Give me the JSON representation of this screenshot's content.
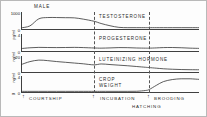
{
  "figure": {
    "title": "MALE",
    "border_color": "#b9b9b9",
    "axis_color": "#404040",
    "curve_color": "#333333"
  },
  "panels": [
    {
      "label": "TESTOSTERONE",
      "unit": "pg/ml",
      "axis_max": "1000",
      "axis_min": "0",
      "label_left": 78,
      "label_top": 2
    },
    {
      "label": "PROGESTERONE",
      "unit": "ng/ml",
      "axis_max": "4",
      "axis_min": "0",
      "label_left": 78,
      "label_top": 2
    },
    {
      "label": "LUTEINIZING HORMONE",
      "unit": "ng/ml",
      "axis_max": "20",
      "axis_min": "0",
      "label_left": 78,
      "label_top": 1
    },
    {
      "label": "CROP\nWEIGHT",
      "label_line1": "CROP",
      "label_line2": "WEIGHT",
      "unit": "g",
      "axis_max": "4",
      "axis_min": "0",
      "label_left": 78,
      "label_top": 1
    }
  ],
  "stages": {
    "courtship": "COURTSHIP",
    "incubation": "INCUBATION",
    "brooding": "BROODING",
    "hatching": "HATCHING",
    "arrow_glyph": "↑"
  },
  "chart_data": {
    "type": "line",
    "title": "MALE",
    "xlabel": "",
    "x_stages": [
      "COURTSHIP",
      "INCUBATION",
      "BROODING"
    ],
    "stage_boundaries_pct": [
      41.0,
      72.0
    ],
    "hatching_marker_pct": 72.0,
    "grid": false,
    "legend": "inline-right",
    "x": [
      0,
      5,
      10,
      15,
      20,
      25,
      30,
      35,
      41,
      45,
      50,
      55,
      60,
      65,
      70,
      72,
      76,
      80,
      85,
      90,
      95,
      100
    ],
    "series": [
      {
        "name": "TESTOSTERONE",
        "ylabel": "pg/ml",
        "ylim": [
          0,
          1000
        ],
        "yticks": [
          0,
          1000
        ],
        "values": [
          60,
          180,
          620,
          700,
          700,
          690,
          680,
          600,
          470,
          330,
          190,
          90,
          70,
          70,
          70,
          70,
          70,
          70,
          70,
          70,
          70,
          70
        ]
      },
      {
        "name": "PROGESTERONE",
        "ylabel": "ng/ml",
        "ylim": [
          0,
          4
        ],
        "yticks": [
          0,
          4
        ],
        "values": [
          0.55,
          0.75,
          0.85,
          0.82,
          0.8,
          0.82,
          0.85,
          0.8,
          0.7,
          0.66,
          0.72,
          0.8,
          0.78,
          0.7,
          0.66,
          0.66,
          0.72,
          0.8,
          0.82,
          0.76,
          0.66,
          0.6
        ]
      },
      {
        "name": "LUTEINIZING HORMONE",
        "ylabel": "ng/ml",
        "ylim": [
          0,
          20
        ],
        "yticks": [
          0,
          20
        ],
        "values": [
          9.5,
          13.5,
          15.5,
          14.8,
          13.6,
          12.6,
          11.6,
          10.6,
          9.2,
          10.4,
          9.6,
          8.8,
          8.0,
          7.0,
          6.0,
          5.6,
          4.8,
          4.0,
          3.4,
          3.0,
          2.8,
          2.7
        ]
      },
      {
        "name": "CROP WEIGHT",
        "ylabel": "g",
        "ylim": [
          0,
          4
        ],
        "yticks": [
          0,
          4
        ],
        "values": [
          0.12,
          0.12,
          0.12,
          0.12,
          0.12,
          0.12,
          0.12,
          0.12,
          0.12,
          0.12,
          0.12,
          0.12,
          0.12,
          0.14,
          0.35,
          0.6,
          1.7,
          2.7,
          3.25,
          3.45,
          3.45,
          3.3
        ]
      }
    ]
  }
}
